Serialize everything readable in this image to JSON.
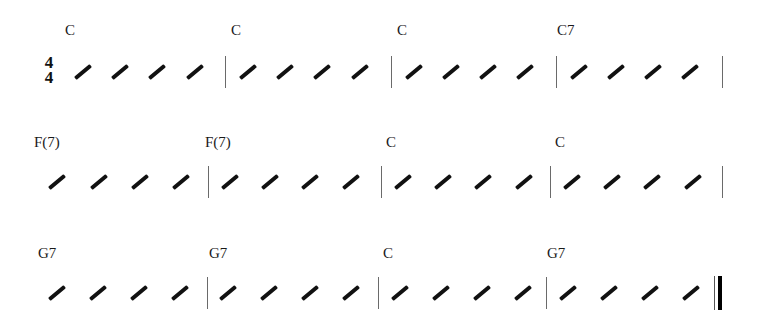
{
  "time_signature": {
    "top": "4",
    "bottom": "4"
  },
  "rows": [
    {
      "measures": [
        {
          "chord": "C",
          "chord_x": 65,
          "beats": 4
        },
        {
          "chord": "C",
          "chord_x": 231,
          "beats": 4
        },
        {
          "chord": "C",
          "chord_x": 397,
          "beats": 4
        },
        {
          "chord": "C7",
          "chord_x": 557,
          "beats": 4
        }
      ]
    },
    {
      "measures": [
        {
          "chord": "F(7)",
          "chord_x": 34,
          "beats": 4
        },
        {
          "chord": "F(7)",
          "chord_x": 205,
          "beats": 4
        },
        {
          "chord": "C",
          "chord_x": 386,
          "beats": 4
        },
        {
          "chord": "C",
          "chord_x": 555,
          "beats": 4
        }
      ]
    },
    {
      "measures": [
        {
          "chord": "G7",
          "chord_x": 38,
          "beats": 4
        },
        {
          "chord": "G7",
          "chord_x": 209,
          "beats": 4
        },
        {
          "chord": "C",
          "chord_x": 383,
          "beats": 4
        },
        {
          "chord": "G7",
          "chord_x": 547,
          "beats": 4
        }
      ]
    }
  ]
}
